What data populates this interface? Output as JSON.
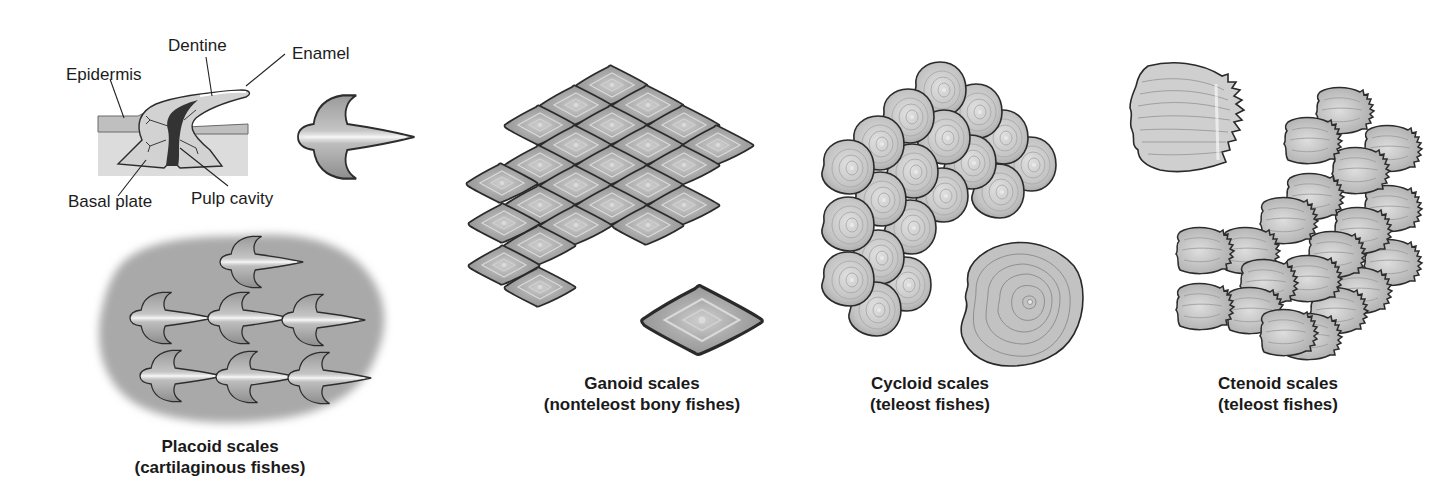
{
  "figure": {
    "panels": [
      {
        "id": "placoid",
        "title": "Placoid scales",
        "subtitle": "(cartilaginous fishes)",
        "anatomy_labels": {
          "dentine": "Dentine",
          "enamel": "Enamel",
          "epidermis": "Epidermis",
          "basal_plate": "Basal plate",
          "pulp_cavity": "Pulp cavity"
        }
      },
      {
        "id": "ganoid",
        "title": "Ganoid scales",
        "subtitle": "(nonteleost bony fishes)"
      },
      {
        "id": "cycloid",
        "title": "Cycloid scales",
        "subtitle": "(teleost fishes)"
      },
      {
        "id": "ctenoid",
        "title": "Ctenoid scales",
        "subtitle": "(teleost fishes)"
      }
    ],
    "colors": {
      "background": "#ffffff",
      "scale_fill": "#b9b9b9",
      "scale_outline": "#2a2a2a",
      "skin_patch": "#a8a8a8",
      "tissue": "#d8d8d8",
      "pulp": "#3a3a3a"
    }
  }
}
